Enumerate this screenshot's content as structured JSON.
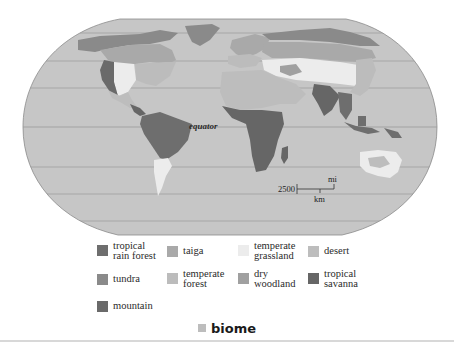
{
  "figure": {
    "title": "biome",
    "equator_label": "equator",
    "scale_bar": {
      "value": "2500",
      "unit_top": "mi",
      "unit_bottom": "km"
    }
  },
  "colors": {
    "ocean": "#c6c6c6",
    "outline": "#8c8c8c",
    "latitude_line": "#9a9a9a",
    "tropical_rain_forest": "#6e6e6e",
    "tundra": "#8a8a8a",
    "mountain": "#6a6a6a",
    "taiga": "#a9a9a9",
    "temperate_forest": "#bcbcbc",
    "temperate_grassland": "#ececec",
    "dry_woodland": "#a0a0a0",
    "desert": "#bdbdbd",
    "tropical_savanna": "#666666",
    "caption_swatch": "#bdbdbd"
  },
  "legend": {
    "items": [
      {
        "label": "tropical\nrain forest",
        "swatch": "#6e6e6e"
      },
      {
        "label": "taiga",
        "swatch": "#a9a9a9"
      },
      {
        "label": "temperate\ngrassland",
        "swatch": "#ececec"
      },
      {
        "label": "desert",
        "swatch": "#bdbdbd"
      },
      {
        "label": "tundra",
        "swatch": "#8a8a8a"
      },
      {
        "label": "temperate\nforest",
        "swatch": "#bcbcbc"
      },
      {
        "label": "dry\nwoodland",
        "swatch": "#a0a0a0"
      },
      {
        "label": "tropical\nsavanna",
        "swatch": "#666666"
      },
      {
        "label": "mountain",
        "swatch": "#6a6a6a"
      }
    ]
  }
}
